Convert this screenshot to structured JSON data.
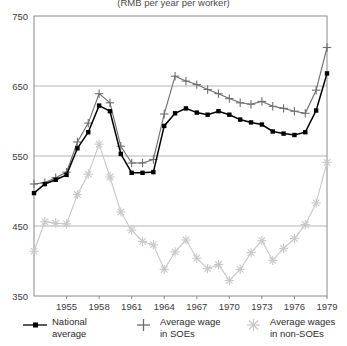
{
  "chart_data": {
    "type": "line",
    "title": "(RMB per year per worker)",
    "xlabel": "",
    "ylabel": "",
    "xlim": [
      1952,
      1979
    ],
    "ylim": [
      350,
      750
    ],
    "yticks": [
      350,
      450,
      550,
      650,
      750
    ],
    "xticks": [
      1955,
      1958,
      1961,
      1964,
      1967,
      1970,
      1973,
      1976,
      1979
    ],
    "grid": "horizontal",
    "legend_position": "below",
    "x": [
      1952,
      1953,
      1954,
      1955,
      1956,
      1957,
      1958,
      1959,
      1960,
      1961,
      1962,
      1963,
      1964,
      1965,
      1966,
      1967,
      1968,
      1969,
      1970,
      1971,
      1972,
      1973,
      1974,
      1975,
      1976,
      1977,
      1978,
      1979
    ],
    "series": [
      {
        "name": "National average",
        "marker": "square",
        "color": "#000000",
        "values": [
          497,
          510,
          516,
          523,
          561,
          584,
          622,
          614,
          553,
          526,
          526,
          527,
          593,
          611,
          618,
          612,
          609,
          614,
          609,
          602,
          598,
          595,
          585,
          582,
          580,
          584,
          615,
          668
        ]
      },
      {
        "name": "Average wage in SOEs",
        "marker": "plus",
        "color": "#6e6e6e",
        "values": [
          510,
          512,
          519,
          527,
          570,
          597,
          639,
          626,
          564,
          540,
          540,
          545,
          610,
          664,
          657,
          652,
          645,
          639,
          632,
          626,
          624,
          628,
          621,
          618,
          614,
          611,
          644,
          705
        ]
      },
      {
        "name": "Average wages in non-SOEs",
        "marker": "asterisk",
        "color": "#c8c8c8",
        "values": [
          414,
          456,
          454,
          453,
          495,
          524,
          567,
          520,
          470,
          444,
          428,
          423,
          388,
          413,
          430,
          404,
          389,
          395,
          372,
          388,
          412,
          429,
          401,
          418,
          432,
          452,
          483,
          541
        ]
      }
    ]
  },
  "legend": {
    "entries": [
      {
        "label": "National\naverage",
        "marker": "square-line-marker"
      },
      {
        "label": "Average wage\nin SOEs",
        "marker": "plus-marker"
      },
      {
        "label": "Average wages\nin non-SOEs",
        "marker": "asterisk-marker"
      }
    ]
  }
}
